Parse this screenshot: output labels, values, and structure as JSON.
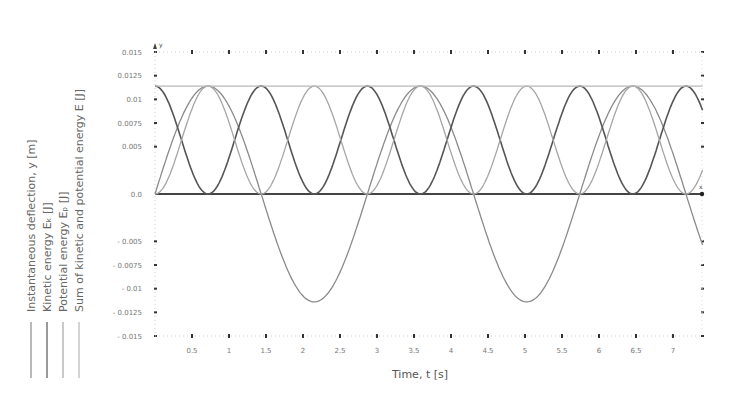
{
  "chart_data": {
    "type": "line",
    "title": "",
    "xlabel": "Time, t [s]",
    "ylabel": "",
    "xlim": [
      0,
      7.4
    ],
    "ylim": [
      -0.015,
      0.015
    ],
    "grid": false,
    "legend_position": "left-vertical",
    "x_ticks": [
      0.5,
      1,
      1.5,
      2,
      2.5,
      3,
      3.5,
      4,
      4.5,
      5,
      5.5,
      6,
      6.5,
      7
    ],
    "x_tick_labels": [
      "0.5",
      "1",
      "1.5",
      "2",
      "2.5",
      "3",
      "3.5",
      "4",
      "4.5",
      "5",
      "5.5",
      "6",
      "6.5",
      "7"
    ],
    "y_ticks": [
      0.015,
      0.0125,
      0.01,
      0.0075,
      0.005,
      0.0,
      -0.005,
      -0.0075,
      -0.01,
      -0.0125,
      -0.015
    ],
    "y_tick_labels": [
      "0.015",
      "0.0125",
      "0.01",
      "0.0075",
      "0.005",
      "0.0",
      "- 0.005",
      "- 0.0075",
      "- 0.01",
      "- 0.0125",
      "- 0.015"
    ],
    "axis_letters": {
      "x": "x",
      "y": "y"
    },
    "model": {
      "amplitude": 0.0114,
      "period_s": 2.87,
      "energy_total": 0.0114
    },
    "series": [
      {
        "name": "Instantaneous deflection, y [m]",
        "color": "#8a8a8a",
        "x": [
          0,
          0.36,
          0.72,
          1.08,
          1.44,
          1.79,
          2.15,
          2.51,
          2.87,
          3.23,
          3.59,
          3.95,
          4.31,
          4.66,
          5.02,
          5.38,
          5.74,
          6.1,
          6.46,
          6.82,
          7.18,
          7.4
        ],
        "values": [
          0.0,
          0.0081,
          0.0114,
          0.0081,
          0.0,
          -0.0081,
          -0.0114,
          -0.0081,
          0.0,
          0.0081,
          0.0114,
          0.0081,
          0.0,
          -0.0081,
          -0.0114,
          -0.0081,
          0.0,
          0.0081,
          0.0114,
          0.0081,
          0.0,
          -0.0049
        ]
      },
      {
        "name": "Kinetic energy E_k [J]",
        "color": "#555555",
        "x": [
          0,
          0.36,
          0.72,
          1.08,
          1.44,
          1.79,
          2.15,
          2.51,
          2.87,
          3.23,
          3.59,
          3.95,
          4.31,
          4.66,
          5.02,
          5.38,
          5.74,
          6.1,
          6.46,
          6.82,
          7.18,
          7.4
        ],
        "values": [
          0.0114,
          0.0057,
          0.0,
          0.0057,
          0.0114,
          0.0057,
          0.0,
          0.0057,
          0.0114,
          0.0057,
          0.0,
          0.0057,
          0.0114,
          0.0057,
          0.0,
          0.0057,
          0.0114,
          0.0057,
          0.0,
          0.0057,
          0.0114,
          0.0093
        ]
      },
      {
        "name": "Potential energy E_p [J]",
        "color": "#a5a5a5",
        "x": [
          0,
          0.36,
          0.72,
          1.08,
          1.44,
          1.79,
          2.15,
          2.51,
          2.87,
          3.23,
          3.59,
          3.95,
          4.31,
          4.66,
          5.02,
          5.38,
          5.74,
          6.1,
          6.46,
          6.82,
          7.18,
          7.4
        ],
        "values": [
          0.0,
          0.0057,
          0.0114,
          0.0057,
          0.0,
          0.0057,
          0.0114,
          0.0057,
          0.0,
          0.0057,
          0.0114,
          0.0057,
          0.0,
          0.0057,
          0.0114,
          0.0057,
          0.0,
          0.0057,
          0.0114,
          0.0057,
          0.0,
          0.0021
        ]
      },
      {
        "name": "Sum of kinetic and potential energy E [J]",
        "color": "#b8b8b8",
        "x": [
          0,
          7.4
        ],
        "values": [
          0.0114,
          0.0114
        ]
      }
    ]
  },
  "legend": {
    "items": [
      {
        "label": "Instantaneous deflection, y [m]",
        "color": "#8a8a8a"
      },
      {
        "label": "Kinetic energy Eₖ [J]",
        "color": "#555555"
      },
      {
        "label": "Potential energy Eₚ [J]",
        "color": "#a5a5a5"
      },
      {
        "label": "Sum of kinetic and potential energy E [J]",
        "color": "#b8b8b8"
      }
    ]
  },
  "layout": {
    "plot_left": 155,
    "plot_right": 702,
    "y_top": 52,
    "y_zero": 194,
    "y_bottom": 336,
    "px_per_second": 74
  }
}
